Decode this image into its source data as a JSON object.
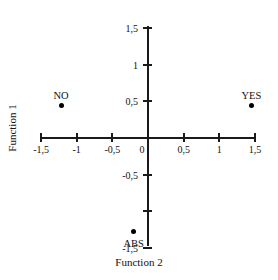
{
  "chart_data": {
    "type": "scatter",
    "title": "",
    "xlabel": "Function 2",
    "ylabel": "Function 1",
    "xlim": [
      -1.5,
      1.5
    ],
    "ylim": [
      -1.5,
      1.5
    ],
    "grid": false,
    "legend": "none",
    "decimal_separator": ",",
    "x_ticks": [
      {
        "value": -1.5,
        "label": "-1,5"
      },
      {
        "value": -1.0,
        "label": "-1"
      },
      {
        "value": -0.5,
        "label": "-0,5"
      },
      {
        "value": 0.0,
        "label": "0"
      },
      {
        "value": 0.5,
        "label": "0,5"
      },
      {
        "value": 1.0,
        "label": "1"
      },
      {
        "value": 1.5,
        "label": "1,5"
      }
    ],
    "y_ticks": [
      {
        "value": 1.5,
        "label": "1,5"
      },
      {
        "value": 1.0,
        "label": "1"
      },
      {
        "value": 0.5,
        "label": "0,5"
      },
      {
        "value": 0.0,
        "label": ""
      },
      {
        "value": -0.5,
        "label": "-0,5"
      },
      {
        "value": -1.0,
        "label": ""
      },
      {
        "value": -1.5,
        "label": "-1,5"
      }
    ],
    "points": [
      {
        "label": "NO",
        "x": -1.22,
        "y": 0.45,
        "label_dx": 0,
        "label_dy": -9
      },
      {
        "label": "YES",
        "x": 1.45,
        "y": 0.45,
        "label_dx": 0,
        "label_dy": -9
      },
      {
        "label": "ABS",
        "x": -0.2,
        "y": -1.28,
        "label_dx": 0,
        "label_dy": 12
      }
    ],
    "marker_color": "#000000",
    "axis_color": "#1a1a1a"
  }
}
